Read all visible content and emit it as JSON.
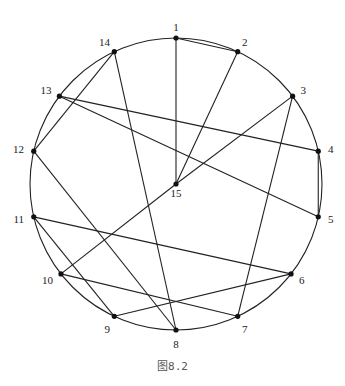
{
  "figure": {
    "caption": "图8.2",
    "stroke_color": "#222222",
    "node_color": "#111111",
    "background": "#ffffff"
  },
  "graph": {
    "layout": "circular",
    "center_node": "15",
    "nodes": [
      {
        "id": "1",
        "label": "1",
        "angle_deg": 90
      },
      {
        "id": "2",
        "label": "2",
        "angle_deg": 65
      },
      {
        "id": "3",
        "label": "3",
        "angle_deg": 37
      },
      {
        "id": "4",
        "label": "4",
        "angle_deg": 13
      },
      {
        "id": "5",
        "label": "5",
        "angle_deg": -13
      },
      {
        "id": "6",
        "label": "6",
        "angle_deg": -38
      },
      {
        "id": "7",
        "label": "7",
        "angle_deg": -65
      },
      {
        "id": "8",
        "label": "8",
        "angle_deg": -90
      },
      {
        "id": "9",
        "label": "9",
        "angle_deg": -115
      },
      {
        "id": "10",
        "label": "10",
        "angle_deg": -142
      },
      {
        "id": "11",
        "label": "11",
        "angle_deg": -167
      },
      {
        "id": "12",
        "label": "12",
        "angle_deg": 167
      },
      {
        "id": "13",
        "label": "13",
        "angle_deg": 143
      },
      {
        "id": "14",
        "label": "14",
        "angle_deg": 115
      },
      {
        "id": "15",
        "label": "15",
        "angle_deg": null
      }
    ],
    "edges": [
      [
        "1",
        "2"
      ],
      [
        "1",
        "15"
      ],
      [
        "2",
        "15"
      ],
      [
        "3",
        "15"
      ],
      [
        "15",
        "10"
      ],
      [
        "3",
        "7"
      ],
      [
        "4",
        "5"
      ],
      [
        "13",
        "4"
      ],
      [
        "13",
        "5"
      ],
      [
        "14",
        "12"
      ],
      [
        "14",
        "8"
      ],
      [
        "12",
        "8"
      ],
      [
        "11",
        "6"
      ],
      [
        "11",
        "9"
      ],
      [
        "10",
        "7"
      ],
      [
        "9",
        "6"
      ]
    ]
  }
}
